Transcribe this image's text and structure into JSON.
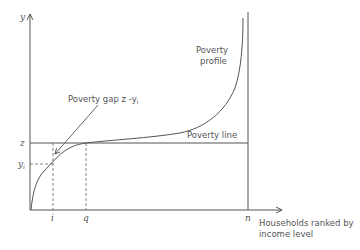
{
  "diagram": {
    "axes": {
      "y_label": "y",
      "x_label_line1": "Households ranked by",
      "x_label_line2": "income level"
    },
    "y_ticks": {
      "z": "z",
      "yi": "y",
      "yi_sub": "i"
    },
    "x_ticks": {
      "i": "i",
      "q": "q",
      "n": "n"
    },
    "annotations": {
      "profile_line1": "Poverty",
      "profile_line2": "profile",
      "poverty_line": "Poverty line",
      "gap": "Poverty gap z -y",
      "gap_sub": "i"
    },
    "colors": {
      "line": "#555555",
      "background": "#ffffff"
    }
  }
}
